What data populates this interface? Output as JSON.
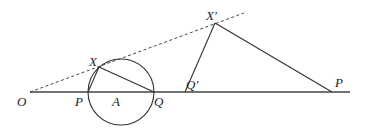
{
  "diagram": {
    "title": "",
    "labels": {
      "O": "O",
      "P": "P",
      "A": "A",
      "Q": "Q",
      "X": "X",
      "Qprime": "Q′",
      "Xprime": "X′",
      "Pprime": "P"
    },
    "colors": {
      "stroke": "#333333",
      "text": "#222222"
    }
  }
}
